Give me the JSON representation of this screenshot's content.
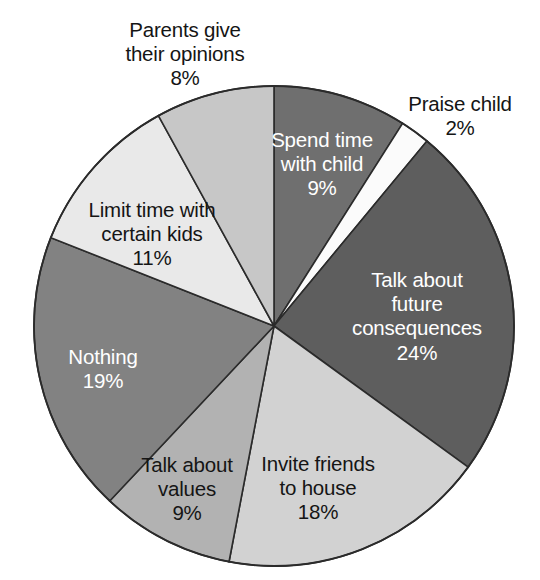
{
  "chart_data": {
    "type": "pie",
    "title": "",
    "subtitle": "",
    "xlabel": "",
    "ylabel": "",
    "legend_position": "none",
    "grid": false,
    "labels_show_percent": true,
    "start_angle_deg": 0,
    "direction": "clockwise",
    "total": 100,
    "categories": [
      "Spend time with child",
      "Praise child",
      "Talk about future consequences",
      "Invite friends to house",
      "Talk about values",
      "Nothing",
      "Limit time with certain kids",
      "Parents give their opinions"
    ],
    "values": [
      9,
      2,
      24,
      18,
      9,
      19,
      11,
      8
    ],
    "slices": [
      {
        "label": "Spend time\nwith child",
        "label_plain": "Spend time with child",
        "percent_text": "9%",
        "value": 9,
        "color": "#6f6f6f",
        "label_placement": "inside",
        "label_color": "#ffffff"
      },
      {
        "label": "Praise child",
        "label_plain": "Praise child",
        "percent_text": "2%",
        "value": 2,
        "color": "#fbfbfb",
        "label_placement": "outside",
        "label_color": "#151515"
      },
      {
        "label": "Talk about\nfuture\nconsequences",
        "label_plain": "Talk about future consequences",
        "percent_text": "24%",
        "value": 24,
        "color": "#5e5e5e",
        "label_placement": "inside",
        "label_color": "#ffffff"
      },
      {
        "label": "Invite friends\nto house",
        "label_plain": "Invite friends to house",
        "percent_text": "18%",
        "value": 18,
        "color": "#d2d2d2",
        "label_placement": "inside",
        "label_color": "#151515"
      },
      {
        "label": "Talk about\nvalues",
        "label_plain": "Talk about values",
        "percent_text": "9%",
        "value": 9,
        "color": "#b2b2b2",
        "label_placement": "inside",
        "label_color": "#151515"
      },
      {
        "label": "Nothing",
        "label_plain": "Nothing",
        "percent_text": "19%",
        "value": 19,
        "color": "#828282",
        "label_placement": "inside",
        "label_color": "#ffffff"
      },
      {
        "label": "Limit time with\ncertain kids",
        "label_plain": "Limit time with certain kids",
        "percent_text": "11%",
        "value": 11,
        "color": "#e9e9e9",
        "label_placement": "inside",
        "label_color": "#151515"
      },
      {
        "label": "Parents give\ntheir opinions",
        "label_plain": "Parents give their opinions",
        "percent_text": "8%",
        "value": 8,
        "color": "#c7c7c7",
        "label_placement": "outside",
        "label_color": "#151515"
      }
    ],
    "geometry": {
      "center_x": 274,
      "center_y": 326,
      "radius": 240,
      "outline_color": "#2b2b2b",
      "background": "#ffffff"
    }
  }
}
